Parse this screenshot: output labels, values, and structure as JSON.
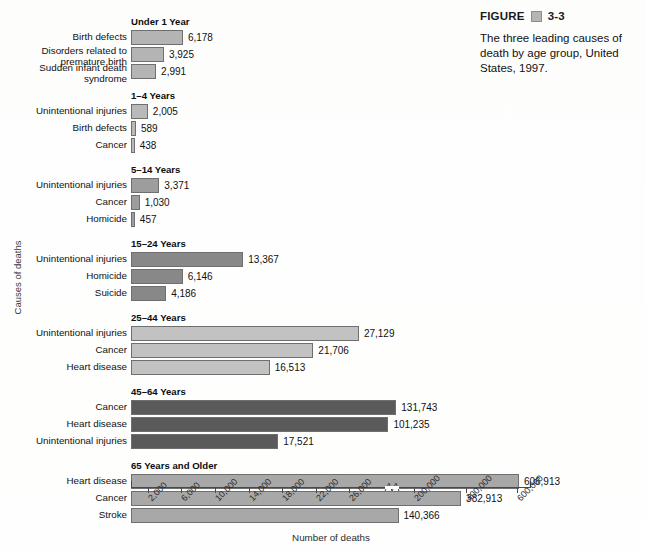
{
  "figure": {
    "label": "FIGURE",
    "number": "3-3",
    "caption": "The three leading causes of death by age group, United States, 1997."
  },
  "chart_data": {
    "type": "bar",
    "orientation": "horizontal",
    "title": "",
    "xlabel": "Number of deaths",
    "ylabel": "Causes of deaths",
    "grid": false,
    "legend": "none",
    "axis_break": true,
    "axis_break_after": 30000,
    "xticks_lower": [
      2000,
      6000,
      10000,
      14000,
      18000,
      22000,
      26000
    ],
    "xticks_upper": [
      200000,
      400000,
      600000
    ],
    "xlim_lower": [
      0,
      28000
    ],
    "xlim_upper": [
      150000,
      650000
    ],
    "groups": [
      {
        "name": "Under 1 Year",
        "shade": "#b4b4b4",
        "categories": [
          "Birth defects",
          "Disorders related to premature birth",
          "Sudden infant death syndrome"
        ],
        "values": [
          6178,
          3925,
          2991
        ],
        "labels": [
          "6,178",
          "3,925",
          "2,991"
        ]
      },
      {
        "name": "1–4 Years",
        "shade": "#b9b9b9",
        "categories": [
          "Unintentional injuries",
          "Birth defects",
          "Cancer"
        ],
        "values": [
          2005,
          589,
          438
        ],
        "labels": [
          "2,005",
          "589",
          "438"
        ]
      },
      {
        "name": "5–14 Years",
        "shade": "#9d9d9d",
        "categories": [
          "Unintentional injuries",
          "Cancer",
          "Homicide"
        ],
        "values": [
          3371,
          1030,
          457
        ],
        "labels": [
          "3,371",
          "1,030",
          "457"
        ]
      },
      {
        "name": "15–24 Years",
        "shade": "#888888",
        "categories": [
          "Unintentional injuries",
          "Homicide",
          "Suicide"
        ],
        "values": [
          13367,
          6146,
          4186
        ],
        "labels": [
          "13,367",
          "6,146",
          "4,186"
        ]
      },
      {
        "name": "25–44 Years",
        "shade": "#c2c2c2",
        "categories": [
          "Unintentional injuries",
          "Cancer",
          "Heart disease"
        ],
        "values": [
          27129,
          21706,
          16513
        ],
        "labels": [
          "27,129",
          "21,706",
          "16,513"
        ]
      },
      {
        "name": "45–64 Years",
        "shade": "#5a5a5a",
        "categories": [
          "Cancer",
          "Heart disease",
          "Unintentional injuries"
        ],
        "values": [
          131743,
          101235,
          17521
        ],
        "labels": [
          "131,743",
          "101,235",
          "17,521"
        ]
      },
      {
        "name": "65 Years and Older",
        "shade": "#a8a8a8",
        "categories": [
          "Heart disease",
          "Cancer",
          "Stroke"
        ],
        "values": [
          606913,
          382913,
          140366
        ],
        "labels": [
          "606,913",
          "382,913",
          "140,366"
        ]
      }
    ]
  }
}
